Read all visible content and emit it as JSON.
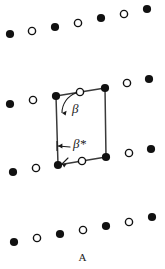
{
  "figure": {
    "label": "A",
    "label_x": 82,
    "label_y": 251,
    "width": 165,
    "height": 269,
    "background": "#ffffff",
    "ink_color": "#1a1a1a",
    "line_color": "#3a3a3a"
  },
  "markers": {
    "filled_label": "filled-circle",
    "open_label": "open-circle",
    "filled_fill": "#111111",
    "open_fill": "#ffffff",
    "open_stroke": "#111111",
    "filled_radius": 4.1,
    "open_radius": 3.6,
    "open_stroke_width": 1.4
  },
  "lattice": {
    "description": "four slanted rows of alternating filled and open circles",
    "rows": [
      {
        "name": "row-1",
        "points": [
          {
            "x": 10,
            "y": 34,
            "type": "filled"
          },
          {
            "x": 32,
            "y": 31,
            "type": "open"
          },
          {
            "x": 55,
            "y": 27,
            "type": "filled"
          },
          {
            "x": 78,
            "y": 23,
            "type": "open"
          },
          {
            "x": 101,
            "y": 18,
            "type": "filled"
          },
          {
            "x": 124,
            "y": 14,
            "type": "open"
          },
          {
            "x": 147,
            "y": 9,
            "type": "filled"
          }
        ]
      },
      {
        "name": "row-2",
        "points": [
          {
            "x": 10,
            "y": 104,
            "type": "filled"
          },
          {
            "x": 33,
            "y": 100,
            "type": "open"
          },
          {
            "x": 56,
            "y": 96,
            "type": "filled"
          },
          {
            "x": 80,
            "y": 92,
            "type": "open"
          },
          {
            "x": 105,
            "y": 88,
            "type": "filled"
          },
          {
            "x": 127,
            "y": 83,
            "type": "open"
          },
          {
            "x": 149,
            "y": 79,
            "type": "filled"
          }
        ]
      },
      {
        "name": "row-3",
        "points": [
          {
            "x": 13,
            "y": 172,
            "type": "filled"
          },
          {
            "x": 36,
            "y": 168,
            "type": "open"
          },
          {
            "x": 58,
            "y": 165,
            "type": "filled"
          },
          {
            "x": 82,
            "y": 161,
            "type": "open"
          },
          {
            "x": 106,
            "y": 157,
            "type": "filled"
          },
          {
            "x": 129,
            "y": 153,
            "type": "open"
          },
          {
            "x": 151,
            "y": 149,
            "type": "filled"
          }
        ]
      },
      {
        "name": "row-4",
        "points": [
          {
            "x": 14,
            "y": 242,
            "type": "filled"
          },
          {
            "x": 37,
            "y": 238,
            "type": "open"
          },
          {
            "x": 60,
            "y": 234,
            "type": "filled"
          },
          {
            "x": 83,
            "y": 230,
            "type": "open"
          },
          {
            "x": 106,
            "y": 226,
            "type": "filled"
          },
          {
            "x": 129,
            "y": 222,
            "type": "open"
          },
          {
            "x": 152,
            "y": 217,
            "type": "filled"
          }
        ]
      }
    ]
  },
  "unit_cell": {
    "name": "unit-cell-parallelogram",
    "corners": {
      "top_left": {
        "x": 56,
        "y": 96
      },
      "top_right": {
        "x": 105,
        "y": 88
      },
      "bottom_right": {
        "x": 106,
        "y": 157
      },
      "bottom_left": {
        "x": 58,
        "y": 165
      }
    },
    "edges": [
      {
        "name": "top-edge",
        "x1": 56,
        "y1": 96,
        "x2": 105,
        "y2": 88
      },
      {
        "name": "right-edge",
        "x1": 105,
        "y1": 88,
        "x2": 106,
        "y2": 157
      },
      {
        "name": "bottom-edge",
        "x1": 106,
        "y1": 157,
        "x2": 58,
        "y2": 165
      },
      {
        "name": "left-edge",
        "x1": 58,
        "y1": 165,
        "x2": 56,
        "y2": 96
      }
    ],
    "stroke_width": 1.5
  },
  "annotations": {
    "beta": {
      "symbol": "β",
      "label_x": 72,
      "label_y": 113,
      "font_size": 13,
      "arc": {
        "start_x": 76,
        "start_y": 93,
        "end_x": 62,
        "end_y": 113,
        "radius": 21
      },
      "arrow_tip": {
        "x": 62,
        "y": 113
      },
      "description": "interior angle at top-left corner between left edge and top edge"
    },
    "beta_star": {
      "symbol": "β*",
      "label_x": 73,
      "label_y": 148,
      "font_size": 13,
      "arrow": {
        "x1": 70,
        "y1": 147,
        "x2": 58,
        "y2": 146
      },
      "tick": {
        "x1": 57,
        "y1": 141,
        "x2": 57,
        "y2": 151
      },
      "corner_marker": {
        "x1": 68,
        "y1": 158,
        "x2": 62,
        "y2": 164
      },
      "description": "reciprocal-lattice angle marked at bottom-left corner"
    }
  }
}
